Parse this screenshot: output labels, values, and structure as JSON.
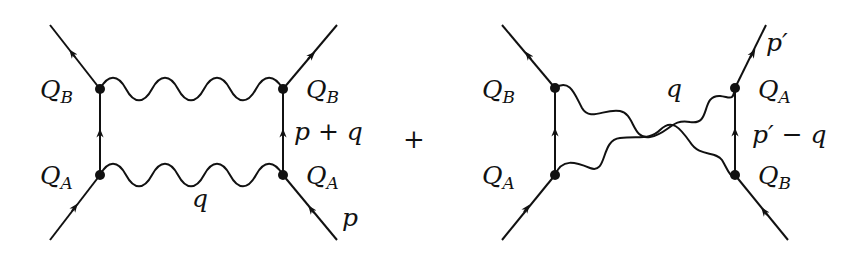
{
  "figure": {
    "operator": "+",
    "colors": {
      "line": "#111111",
      "background": "#ffffff"
    },
    "diagrams": [
      {
        "id": "direct-box",
        "labels": {
          "top_left": {
            "main": "Q",
            "sub": "B"
          },
          "bottom_left": {
            "main": "Q",
            "sub": "A"
          },
          "top_right": {
            "main": "Q",
            "sub": "B"
          },
          "bottom_right": {
            "main": "Q",
            "sub": "A"
          },
          "right_propagator": "p + q",
          "bottom_photon": "q",
          "incoming_momentum": "p"
        }
      },
      {
        "id": "crossed-box",
        "labels": {
          "top_left": {
            "main": "Q",
            "sub": "B"
          },
          "bottom_left": {
            "main": "Q",
            "sub": "A"
          },
          "top_right": {
            "main": "Q",
            "sub": "A"
          },
          "bottom_right": {
            "main": "Q",
            "sub": "B"
          },
          "right_propagator": "p′ − q",
          "photon": "q",
          "outgoing_momentum": "p′"
        }
      }
    ]
  }
}
